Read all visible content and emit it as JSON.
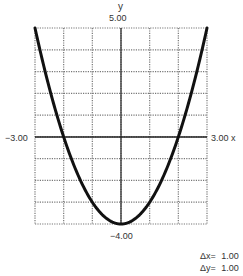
{
  "chart_data": {
    "type": "line",
    "title": "",
    "function": "y = x^2 - 4",
    "xlabel": "x",
    "ylabel": "y",
    "xlim": [
      -3,
      3
    ],
    "ylim": [
      -4,
      5
    ],
    "grid": true,
    "grid_style": "dotted",
    "x": [
      -3,
      -2.5,
      -2,
      -1.5,
      -1,
      -0.5,
      0,
      0.5,
      1,
      1.5,
      2,
      2.5,
      3
    ],
    "series": [
      {
        "name": "y",
        "values": [
          5,
          2.25,
          0,
          -1.75,
          -3,
          -3.75,
          -4,
          -3.75,
          -3,
          -1.75,
          0,
          2.25,
          5
        ]
      }
    ],
    "tick_labels": {
      "x_min": "−3.00",
      "x_max": "3.00",
      "y_max": "5.00",
      "y_min": "−4.00"
    },
    "scale": {
      "dx_label": "Δx=",
      "dx": "1.00",
      "dy_label": "Δy=",
      "dy": "1.00"
    }
  }
}
